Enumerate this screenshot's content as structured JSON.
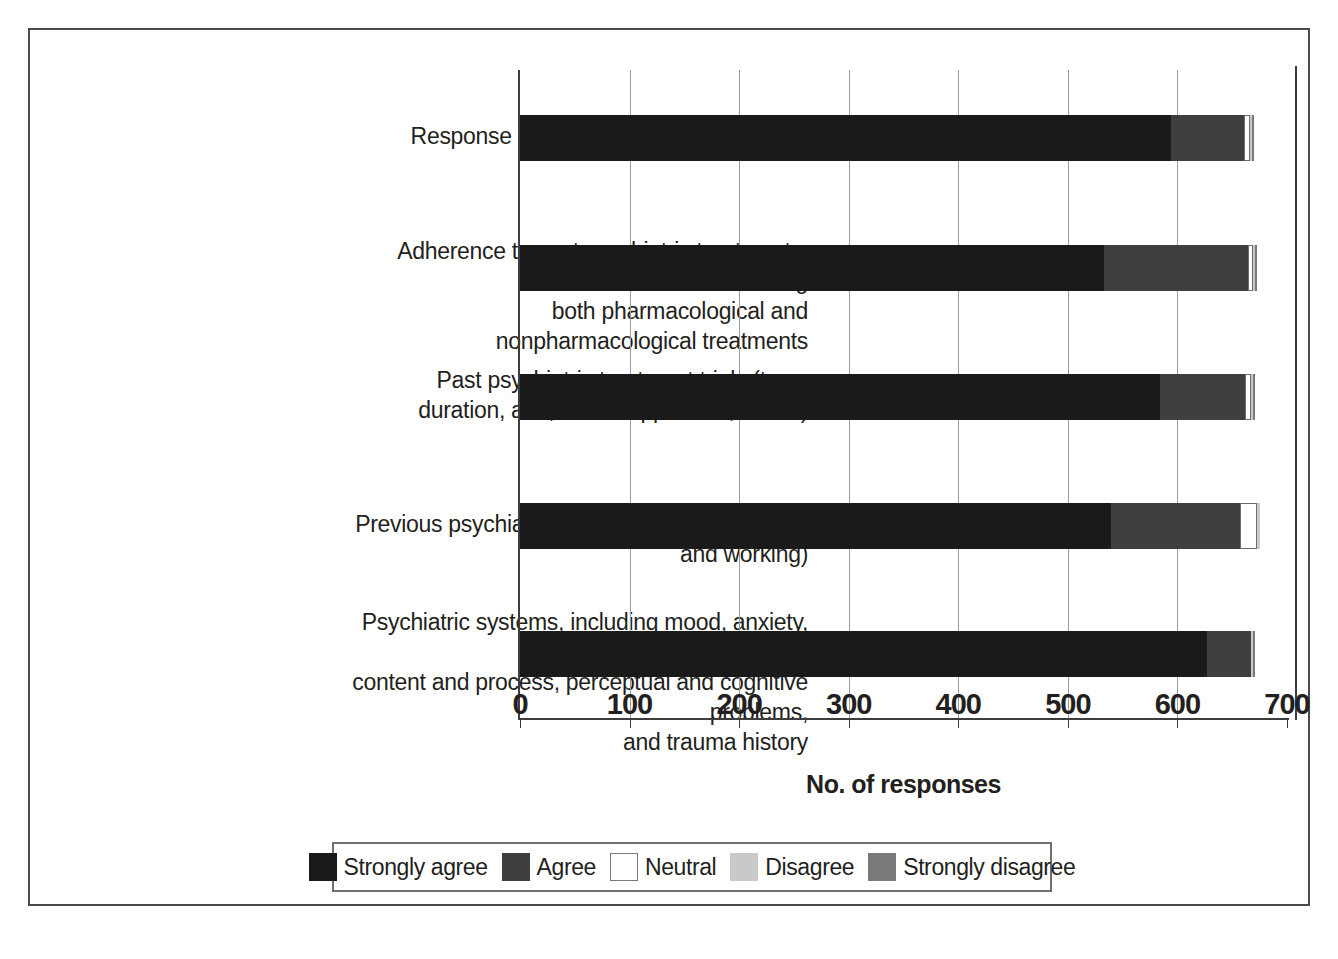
{
  "chart_data": {
    "type": "bar",
    "orientation": "horizontal",
    "stacked": true,
    "title": "",
    "xlabel": "No. of responses",
    "ylabel": "",
    "xlim": [
      0,
      700
    ],
    "xticks": [
      0,
      100,
      200,
      300,
      400,
      500,
      600,
      700
    ],
    "xtick_labels": [
      "0",
      "100",
      "200",
      "300",
      "400",
      "500",
      "600",
      "700"
    ],
    "grid": "vertical",
    "legend_position": "bottom",
    "categories": [
      "Response to past psychiatric treatments",
      "Adherence to past psychiatric treatments, including both pharmacological and nonpharmacological treatments",
      "Past psychiatric treatment trials (type, duration, and, where applicable, doses)",
      "Previous psychiatric diagnoses (both principal and working)",
      "Psychiatric systems, including mood, anxiety, thought content and process, perceptual and cognitive problems, and trauma history"
    ],
    "category_lines": [
      [
        "Response to past psychiatric treatments"
      ],
      [
        "Adherence to past psychiatric treatments, including",
        "both pharmacological and nonpharmacological treatments"
      ],
      [
        "Past psychiatric treatment trials (type,",
        "duration, and, where applicable, doses)"
      ],
      [
        "Previous psychiatric diagnoses (both principal and working)"
      ],
      [
        "Psychiatric systems, including mood, anxiety, thought",
        "content and process, perceptual and cognitive problems,",
        "and trauma history"
      ]
    ],
    "series": [
      {
        "name": "Strongly agree",
        "color": "#1a1a1a",
        "values": [
          594,
          533,
          584,
          539,
          627
        ]
      },
      {
        "name": "Agree",
        "color": "#3f3f3f",
        "values": [
          67,
          131,
          78,
          118,
          40
        ]
      },
      {
        "name": "Neutral",
        "color": "#ffffff",
        "values": [
          5,
          5,
          5,
          16,
          0
        ]
      },
      {
        "name": "Disagree",
        "color": "#c9c9c9",
        "values": [
          2,
          2,
          2,
          2,
          2
        ]
      },
      {
        "name": "Strongly disagree",
        "color": "#7a7a7a",
        "values": [
          2,
          2,
          2,
          0,
          2
        ]
      }
    ],
    "totals": [
      670,
      673,
      671,
      675,
      671
    ]
  },
  "legend": {
    "items": [
      {
        "label": "Strongly agree",
        "color": "#1a1a1a",
        "outlined": false
      },
      {
        "label": "Agree",
        "color": "#3f3f3f",
        "outlined": false
      },
      {
        "label": "Neutral",
        "color": "#ffffff",
        "outlined": true
      },
      {
        "label": "Disagree",
        "color": "#c9c9c9",
        "outlined": false
      },
      {
        "label": "Strongly disagree",
        "color": "#7a7a7a",
        "outlined": false
      }
    ]
  },
  "axis": {
    "x_title": "No. of responses"
  }
}
